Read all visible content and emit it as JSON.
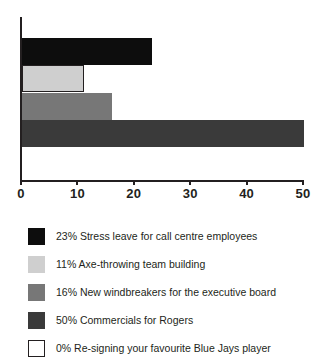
{
  "chart_data": {
    "type": "bar",
    "orientation": "horizontal",
    "title": "",
    "xlabel": "",
    "ylabel": "",
    "xlim": [
      0,
      50
    ],
    "xticks": [
      0,
      10,
      20,
      30,
      40,
      50
    ],
    "xtick_labels": [
      "0",
      "10",
      "20",
      "30",
      "40",
      "50"
    ],
    "grid": false,
    "legend_position": "below",
    "categories": [
      "Stress leave for call centre employees",
      "Axe-throwing team building",
      "New windbreakers for the executive board",
      "Commercials for Rogers",
      "Re-signing your favourite Blue Jays player"
    ],
    "values": [
      23,
      11,
      16,
      50,
      0
    ],
    "value_labels": [
      "23%",
      "11%",
      "16%",
      "50%",
      "0%"
    ],
    "colors": [
      "#0d0d0d",
      "#cfcfcf",
      "#777777",
      "#3a3a3a",
      "#ffffff"
    ],
    "bars": [
      {
        "value": 23,
        "color": "#0d0d0d",
        "outlined": false
      },
      {
        "value": 11,
        "color": "#cfcfcf",
        "outlined": true
      },
      {
        "value": 16,
        "color": "#777777",
        "outlined": false
      },
      {
        "value": 50,
        "color": "#3a3a3a",
        "outlined": false
      }
    ]
  },
  "axis": {
    "ticks": [
      {
        "label": "0"
      },
      {
        "label": "10"
      },
      {
        "label": "20"
      },
      {
        "label": "30"
      },
      {
        "label": "40"
      },
      {
        "label": "50"
      }
    ]
  },
  "legend": {
    "items": [
      {
        "label": "23% Stress leave for call centre employees",
        "color": "#0d0d0d",
        "outlined": false
      },
      {
        "label": "11% Axe-throwing team building",
        "color": "#cfcfcf",
        "outlined": false
      },
      {
        "label": "16% New windbreakers for the executive board",
        "color": "#777777",
        "outlined": false
      },
      {
        "label": "50% Commercials for Rogers",
        "color": "#3a3a3a",
        "outlined": false
      },
      {
        "label": "0% Re-signing your favourite Blue Jays player",
        "color": "#ffffff",
        "outlined": true
      }
    ]
  }
}
